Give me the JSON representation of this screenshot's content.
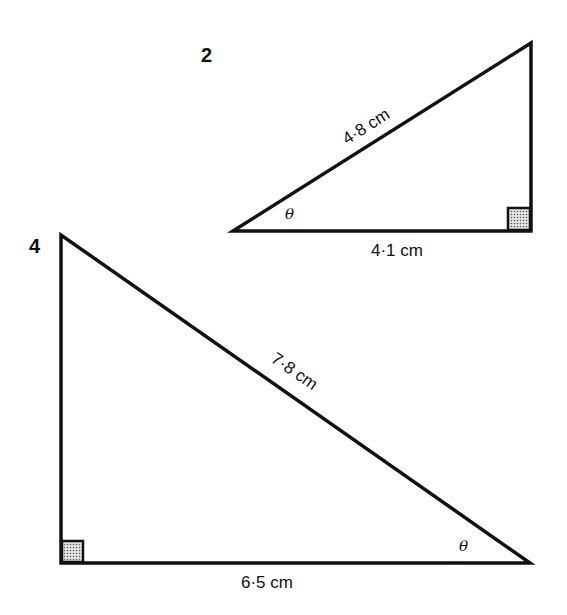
{
  "diagram": {
    "type": "right-triangle-trigonometry-exercises",
    "background": "#ffffff",
    "line_color": "#111111",
    "triangles": [
      {
        "number": "2",
        "hypotenuse_label": "4·8 cm",
        "adjacent_label": "4·1 cm",
        "angle_label": "θ",
        "right_angle_position": "bottom-right",
        "angle_position": "bottom-left"
      },
      {
        "number": "4",
        "hypotenuse_label": "7·8 cm",
        "adjacent_label": "6·5 cm",
        "angle_label": "θ",
        "right_angle_position": "bottom-left",
        "angle_position": "bottom-right"
      }
    ]
  }
}
